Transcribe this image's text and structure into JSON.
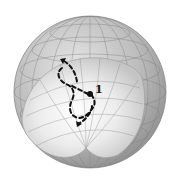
{
  "diagram": {
    "type": "sphere-with-cutaway-wedge",
    "point_label": "1",
    "colors": {
      "background": "#ffffff",
      "outer_shell": "#a9a9a9",
      "outer_shell_light": "#d4d4d4",
      "inner_highlight": "#fafafa",
      "grid": "#7a7a7a",
      "path": "#111111",
      "point": "#111111"
    },
    "elements": [
      {
        "name": "sphere",
        "desc": "grey sphere with latitude/longitude grid and a front wedge cut away"
      },
      {
        "name": "dashed-trajectory",
        "desc": "dashed curved path with arrowheads"
      },
      {
        "name": "point",
        "label": "1"
      }
    ]
  }
}
